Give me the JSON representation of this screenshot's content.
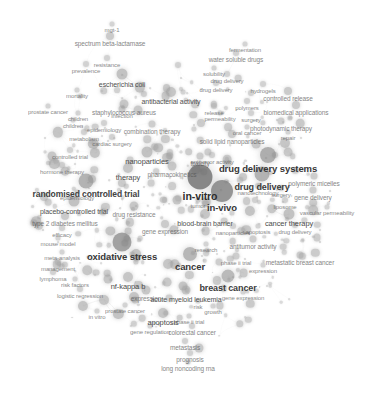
{
  "visualization": {
    "kind": "bibliometric-term-co-occurrence-network",
    "background_color": "#ffffff",
    "node_color": "#7d7d7d",
    "edge_color": "#d9d9d9",
    "label_color": "#3a3a3a",
    "width": 379,
    "height": 397,
    "title": "",
    "legend": "",
    "axes": "none"
  },
  "chart_data": {
    "type": "scatter",
    "title": "",
    "xlabel": "",
    "ylabel": "",
    "grid": false,
    "legend_position": "none",
    "xlim": [
      0,
      379
    ],
    "ylim": [
      0,
      397
    ],
    "nodes": [
      {
        "label": "in-vitro",
        "x": 200,
        "y": 177,
        "size": 25,
        "font": 10.5,
        "weight": 100
      },
      {
        "label": "in-vivo",
        "x": 222,
        "y": 191,
        "size": 22,
        "font": 9.5,
        "weight": 88
      },
      {
        "label": "oxidative stress",
        "x": 122,
        "y": 242,
        "size": 19,
        "font": 9.5,
        "weight": 80
      },
      {
        "label": "drug delivery systems",
        "x": 268,
        "y": 155,
        "size": 16,
        "font": 9.5,
        "weight": 72
      },
      {
        "label": "drug delivery",
        "x": 262,
        "y": 174,
        "size": 15,
        "font": 9,
        "weight": 68
      },
      {
        "label": "randomised controlled trial",
        "x": 86,
        "y": 181,
        "size": 15,
        "font": 8.5,
        "weight": 66
      },
      {
        "label": "cancer",
        "x": 190,
        "y": 254,
        "size": 14,
        "font": 9.5,
        "weight": 64
      },
      {
        "label": "breast cancer",
        "x": 228,
        "y": 276,
        "size": 13,
        "font": 9,
        "weight": 60
      },
      {
        "label": "cancer therapy",
        "x": 289,
        "y": 214,
        "size": 11,
        "font": 7.5,
        "weight": 48
      },
      {
        "label": "blood-brain barrier",
        "x": 205,
        "y": 214,
        "size": 10,
        "font": 7,
        "weight": 44
      },
      {
        "label": "placebo-controlled trial",
        "x": 74,
        "y": 201,
        "size": 11,
        "font": 7,
        "weight": 44
      },
      {
        "label": "escherichia coli",
        "x": 122,
        "y": 74,
        "size": 11,
        "font": 7,
        "weight": 42
      },
      {
        "label": "antibacterial activity",
        "x": 171,
        "y": 92,
        "size": 10,
        "font": 7,
        "weight": 40
      },
      {
        "label": "spectrum beta-lactamase",
        "x": 110,
        "y": 36,
        "size": 8,
        "font": 6.5,
        "weight": 34
      },
      {
        "label": "staphylococcus aureus",
        "x": 124,
        "y": 104,
        "size": 9,
        "font": 6.5,
        "weight": 34
      },
      {
        "label": "apoptosis",
        "x": 163,
        "y": 313,
        "size": 10,
        "font": 7.5,
        "weight": 40
      },
      {
        "label": "nf-kappa b",
        "x": 128,
        "y": 277,
        "size": 10,
        "font": 7.5,
        "weight": 40
      },
      {
        "label": "acute myeloid leukemia",
        "x": 186,
        "y": 290,
        "size": 9,
        "font": 7,
        "weight": 36
      },
      {
        "label": "therapy",
        "x": 128,
        "y": 168,
        "size": 10,
        "font": 7.5,
        "weight": 38
      },
      {
        "label": "expression",
        "x": 146,
        "y": 290,
        "size": 9,
        "font": 6.5,
        "weight": 34
      },
      {
        "label": "type 2 diabetes mellitus",
        "x": 65,
        "y": 216,
        "size": 8,
        "font": 6.5,
        "weight": 30
      },
      {
        "label": "solid lipid nanoparticles",
        "x": 232,
        "y": 134,
        "size": 8,
        "font": 6.5,
        "weight": 30
      },
      {
        "label": "biomedical applications",
        "x": 296,
        "y": 105,
        "size": 8,
        "font": 6.5,
        "weight": 30
      },
      {
        "label": "controlled release",
        "x": 288,
        "y": 91,
        "size": 8,
        "font": 6.5,
        "weight": 30
      },
      {
        "label": "photodynamic therapy",
        "x": 281,
        "y": 121,
        "size": 7,
        "font": 6.5,
        "weight": 28
      },
      {
        "label": "water soluble drugs",
        "x": 236,
        "y": 53,
        "size": 6,
        "font": 6.5,
        "weight": 24
      },
      {
        "label": "metastatic breast cancer",
        "x": 300,
        "y": 255,
        "size": 7,
        "font": 6.5,
        "weight": 26
      },
      {
        "label": "antitumor activity",
        "x": 253,
        "y": 239,
        "size": 7,
        "font": 6.5,
        "weight": 26
      },
      {
        "label": "polymeric micelles",
        "x": 314,
        "y": 176,
        "size": 7,
        "font": 6.5,
        "weight": 26
      },
      {
        "label": "gene delivery",
        "x": 313,
        "y": 190,
        "size": 7,
        "font": 6.5,
        "weight": 26
      },
      {
        "label": "vascular permeability",
        "x": 327,
        "y": 207,
        "size": 5,
        "font": 6,
        "weight": 20
      },
      {
        "label": "combination therapy",
        "x": 152,
        "y": 124,
        "size": 7,
        "font": 6.5,
        "weight": 26
      },
      {
        "label": "colorectal cancer",
        "x": 192,
        "y": 326,
        "size": 6,
        "font": 6.5,
        "weight": 24
      },
      {
        "label": "metastasis",
        "x": 185,
        "y": 341,
        "size": 6,
        "font": 6.5,
        "weight": 24
      },
      {
        "label": "prognosis",
        "x": 190,
        "y": 353,
        "size": 6,
        "font": 6.5,
        "weight": 24
      },
      {
        "label": "long noncoding rna",
        "x": 188,
        "y": 362,
        "size": 5,
        "font": 6.5,
        "weight": 20
      },
      {
        "label": "drug resistance",
        "x": 134,
        "y": 206,
        "size": 9,
        "font": 6.5,
        "weight": 32
      },
      {
        "label": "gene expression",
        "x": 165,
        "y": 224,
        "size": 8,
        "font": 6.5,
        "weight": 30
      },
      {
        "label": "pharmacokinetics",
        "x": 172,
        "y": 166,
        "size": 9,
        "font": 6.5,
        "weight": 32
      },
      {
        "label": "nanoparticles",
        "x": 147,
        "y": 152,
        "size": 11,
        "font": 7.5,
        "weight": 44
      },
      {
        "label": "toxicity",
        "x": 200,
        "y": 156,
        "size": 7,
        "font": 6.5,
        "weight": 26
      },
      {
        "label": "solubility",
        "x": 214,
        "y": 68,
        "size": 5,
        "font": 6,
        "weight": 20
      },
      {
        "label": "drug delivery",
        "x": 227,
        "y": 74,
        "size": 6,
        "font": 6,
        "weight": 22
      },
      {
        "label": "drug delivery",
        "x": 216,
        "y": 83,
        "size": 6,
        "font": 6,
        "weight": 22
      },
      {
        "label": "hydrogels",
        "x": 263,
        "y": 84,
        "size": 6,
        "font": 6,
        "weight": 22
      },
      {
        "label": "polymers",
        "x": 247,
        "y": 101,
        "size": 6,
        "font": 6,
        "weight": 22
      },
      {
        "label": "release",
        "x": 214,
        "y": 106,
        "size": 6,
        "font": 6,
        "weight": 22
      },
      {
        "label": "permeability",
        "x": 220,
        "y": 113,
        "size": 5,
        "font": 6,
        "weight": 20
      },
      {
        "label": "surgery",
        "x": 251,
        "y": 113,
        "size": 6,
        "font": 6,
        "weight": 22
      },
      {
        "label": "oral cancer",
        "x": 247,
        "y": 127,
        "size": 5,
        "font": 6,
        "weight": 20
      },
      {
        "label": "repair",
        "x": 288,
        "y": 132,
        "size": 5,
        "font": 6,
        "weight": 20
      },
      {
        "label": "nanotechnology",
        "x": 258,
        "y": 186,
        "size": 6,
        "font": 6,
        "weight": 22
      },
      {
        "label": "surgery",
        "x": 281,
        "y": 188,
        "size": 6,
        "font": 6,
        "weight": 22
      },
      {
        "label": "liposome",
        "x": 285,
        "y": 200,
        "size": 6,
        "font": 6,
        "weight": 22
      },
      {
        "label": "drug delivery",
        "x": 295,
        "y": 225,
        "size": 6,
        "font": 6,
        "weight": 22
      },
      {
        "label": "nanoparticles",
        "x": 233,
        "y": 226,
        "size": 6,
        "font": 6,
        "weight": 22
      },
      {
        "label": "research",
        "x": 206,
        "y": 244,
        "size": 5,
        "font": 6,
        "weight": 20
      },
      {
        "label": "phase ii trial",
        "x": 236,
        "y": 256,
        "size": 7,
        "font": 6,
        "weight": 24
      },
      {
        "label": "expression",
        "x": 263,
        "y": 265,
        "size": 5,
        "font": 6,
        "weight": 20
      },
      {
        "label": "gene expression",
        "x": 243,
        "y": 292,
        "size": 5,
        "font": 6,
        "weight": 20
      },
      {
        "label": "risk",
        "x": 198,
        "y": 301,
        "size": 5,
        "font": 6,
        "weight": 20
      },
      {
        "label": "growth",
        "x": 213,
        "y": 306,
        "size": 5,
        "font": 6,
        "weight": 20
      },
      {
        "label": "phase ii trial",
        "x": 189,
        "y": 316,
        "size": 5,
        "font": 6,
        "weight": 20
      },
      {
        "label": "gene regulation",
        "x": 150,
        "y": 326,
        "size": 5,
        "font": 6,
        "weight": 20
      },
      {
        "label": "prostate cancer",
        "x": 125,
        "y": 305,
        "size": 5,
        "font": 6,
        "weight": 20
      },
      {
        "label": "in vitro",
        "x": 97,
        "y": 311,
        "size": 5,
        "font": 6,
        "weight": 20
      },
      {
        "label": "logistic regression",
        "x": 80,
        "y": 289,
        "size": 6,
        "font": 6,
        "weight": 22
      },
      {
        "label": "risk factors",
        "x": 75,
        "y": 279,
        "size": 5,
        "font": 6,
        "weight": 20
      },
      {
        "label": "lymphoma",
        "x": 53,
        "y": 272,
        "size": 6,
        "font": 6,
        "weight": 22
      },
      {
        "label": "meta-analysis",
        "x": 62,
        "y": 252,
        "size": 5,
        "font": 6,
        "weight": 20
      },
      {
        "label": "management",
        "x": 58,
        "y": 262,
        "size": 6,
        "font": 6,
        "weight": 22
      },
      {
        "label": "mouse model",
        "x": 58,
        "y": 238,
        "size": 5,
        "font": 6,
        "weight": 20
      },
      {
        "label": "efficacy",
        "x": 62,
        "y": 228,
        "size": 6,
        "font": 6,
        "weight": 22
      },
      {
        "label": "epidemiology",
        "x": 77,
        "y": 192,
        "size": 5,
        "font": 6,
        "weight": 20
      },
      {
        "label": "hormone therapy",
        "x": 62,
        "y": 165,
        "size": 6,
        "font": 6,
        "weight": 22
      },
      {
        "label": "controlled trial",
        "x": 70,
        "y": 150,
        "size": 6,
        "font": 6,
        "weight": 22
      },
      {
        "label": "cardiac surgery",
        "x": 112,
        "y": 137,
        "size": 6,
        "font": 6,
        "weight": 22
      },
      {
        "label": "metabolism",
        "x": 84,
        "y": 132,
        "size": 6,
        "font": 6,
        "weight": 22
      },
      {
        "label": "epidemiology",
        "x": 104,
        "y": 123,
        "size": 6,
        "font": 6,
        "weight": 22
      },
      {
        "label": "children",
        "x": 73,
        "y": 120,
        "size": 5,
        "font": 6,
        "weight": 20
      },
      {
        "label": "children",
        "x": 78,
        "y": 113,
        "size": 5,
        "font": 6,
        "weight": 20
      },
      {
        "label": "infection",
        "x": 122,
        "y": 109,
        "size": 7,
        "font": 6,
        "weight": 26
      },
      {
        "label": "prostate cancer",
        "x": 48,
        "y": 106,
        "size": 5,
        "font": 6,
        "weight": 20
      },
      {
        "label": "mortality",
        "x": 77,
        "y": 90,
        "size": 5,
        "font": 6,
        "weight": 20
      },
      {
        "label": "resistance",
        "x": 107,
        "y": 58,
        "size": 6,
        "font": 6,
        "weight": 22
      },
      {
        "label": "prevalence",
        "x": 86,
        "y": 64,
        "size": 6,
        "font": 6,
        "weight": 22
      },
      {
        "label": "mgt-1",
        "x": 112,
        "y": 24,
        "size": 5,
        "font": 6,
        "weight": 20
      },
      {
        "label": "fermentation",
        "x": 245,
        "y": 44,
        "size": 5,
        "font": 6,
        "weight": 20
      },
      {
        "label": "antitumor activity",
        "x": 212,
        "y": 155,
        "size": 6,
        "font": 6,
        "weight": 22
      },
      {
        "label": "tumor",
        "x": 198,
        "y": 200,
        "size": 5,
        "font": 6,
        "weight": 20
      },
      {
        "label": "apoptosis",
        "x": 258,
        "y": 226,
        "size": 5,
        "font": 6,
        "weight": 20
      }
    ],
    "clusters": [
      {
        "name": "drug-delivery-nanomedicine",
        "anchor": "drug delivery systems",
        "region": "right"
      },
      {
        "name": "clinical-trials-epidemiology",
        "anchor": "randomised controlled trial",
        "region": "left"
      },
      {
        "name": "oncology-molecular-biology",
        "anchor": "cancer",
        "region": "bottom-center"
      },
      {
        "name": "microbiology-antibacterial",
        "anchor": "escherichia coli",
        "region": "top-left"
      },
      {
        "name": "preclinical-pharmacology",
        "anchor": "in-vitro",
        "region": "center"
      }
    ]
  }
}
